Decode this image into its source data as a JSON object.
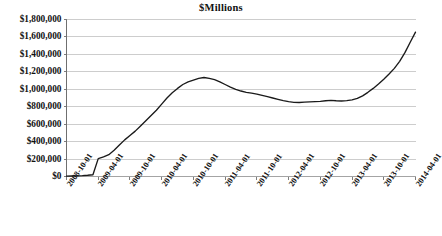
{
  "chart_data": {
    "type": "line",
    "title": "$Millions",
    "xlabel": "",
    "ylabel": "",
    "ylim": [
      0,
      1800000
    ],
    "ytick_values": [
      0,
      200000,
      400000,
      600000,
      800000,
      1000000,
      1200000,
      1400000,
      1600000,
      1800000
    ],
    "ytick_labels": [
      "$0",
      "$200,000",
      "$400,000",
      "$600,000",
      "$800,000",
      "$1,000,000",
      "$1,200,000",
      "$1,400,000",
      "$1,600,000",
      "$1,800,000"
    ],
    "xtick_labels": [
      "2008-10-01",
      "2009-04-01",
      "2009-10-01",
      "2010-04-01",
      "2010-10-01",
      "2011-04-01",
      "2011-10-01",
      "2012-04-01",
      "2012-10-01",
      "2013-04-01",
      "2013-10-01",
      "2014-04-01"
    ],
    "grid": "horizontal",
    "legend": "none",
    "line_color": "#1a1a1a",
    "gridline_color": "#b8b8b8",
    "axis_color": "#808080",
    "x": [
      "2008-10-01",
      "2008-11-01",
      "2008-12-01",
      "2009-01-01",
      "2009-02-01",
      "2009-03-01",
      "2009-04-01",
      "2009-05-01",
      "2009-06-01",
      "2009-07-01",
      "2009-08-01",
      "2009-09-01",
      "2009-10-01",
      "2009-11-01",
      "2009-12-01",
      "2010-01-01",
      "2010-02-01",
      "2010-03-01",
      "2010-04-01",
      "2010-05-01",
      "2010-06-01",
      "2010-07-01",
      "2010-08-01",
      "2010-09-01",
      "2010-10-01",
      "2010-11-01",
      "2010-12-01",
      "2011-01-01",
      "2011-02-01",
      "2011-03-01",
      "2011-04-01",
      "2011-05-01",
      "2011-06-01",
      "2011-07-01",
      "2011-08-01",
      "2011-09-01",
      "2011-10-01",
      "2011-11-01",
      "2011-12-01",
      "2012-01-01",
      "2012-02-01",
      "2012-03-01",
      "2012-04-01",
      "2012-05-01",
      "2012-06-01",
      "2012-07-01",
      "2012-08-01",
      "2012-09-01",
      "2012-10-01",
      "2012-11-01",
      "2012-12-01",
      "2013-01-01",
      "2013-02-01",
      "2013-03-01",
      "2013-04-01",
      "2013-05-01",
      "2013-06-01",
      "2013-07-01",
      "2013-08-01",
      "2013-09-01",
      "2013-10-01",
      "2013-11-01",
      "2013-12-01",
      "2014-01-01",
      "2014-02-01",
      "2014-03-01",
      "2014-04-01"
    ],
    "values": [
      5000,
      6000,
      8000,
      10000,
      14000,
      20000,
      205000,
      225000,
      250000,
      300000,
      360000,
      420000,
      470000,
      520000,
      580000,
      640000,
      700000,
      760000,
      830000,
      900000,
      960000,
      1010000,
      1055000,
      1085000,
      1105000,
      1125000,
      1135000,
      1125000,
      1110000,
      1085000,
      1055000,
      1025000,
      1000000,
      980000,
      965000,
      955000,
      945000,
      930000,
      915000,
      900000,
      885000,
      870000,
      858000,
      850000,
      848000,
      852000,
      855000,
      858000,
      862000,
      868000,
      872000,
      868000,
      866000,
      870000,
      878000,
      895000,
      925000,
      965000,
      1010000,
      1060000,
      1115000,
      1175000,
      1240000,
      1320000,
      1420000,
      1540000,
      1655000
    ]
  }
}
